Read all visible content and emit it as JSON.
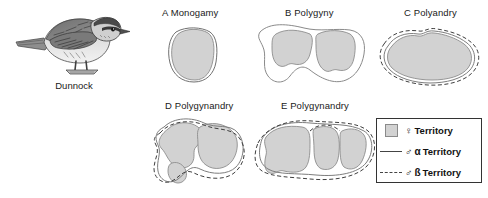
{
  "figure": {
    "title_present": false,
    "background_color": "#ffffff"
  },
  "bird": {
    "caption": "Dunnock",
    "icon_name": "dunnock-bird-illustration"
  },
  "panels": [
    {
      "id": "A",
      "label": "A Monogamy",
      "female_territories": 1,
      "alpha_male": true,
      "beta_male": false
    },
    {
      "id": "B",
      "label": "B Polygyny",
      "female_territories": 2,
      "alpha_male": true,
      "beta_male": false
    },
    {
      "id": "C",
      "label": "C Polyandry",
      "female_territories": 1,
      "alpha_male": true,
      "beta_male": true
    },
    {
      "id": "D",
      "label": "D Polygynandry",
      "female_territories": 2,
      "alpha_male": true,
      "beta_male": true
    },
    {
      "id": "E",
      "label": "E Polygynandry",
      "female_territories": 3,
      "alpha_male": true,
      "beta_male": true
    }
  ],
  "legend": {
    "items": [
      {
        "symbol": "♀",
        "label": "Territory",
        "swatch": "filled-square",
        "color": "#d2d2d2"
      },
      {
        "symbol": "♂",
        "greek": "α",
        "label": "Territory",
        "swatch": "solid-line",
        "color": "#444444"
      },
      {
        "symbol": "♂",
        "greek": "ß",
        "label": "Territory",
        "swatch": "dashed-line",
        "color": "#444444"
      }
    ]
  },
  "colors": {
    "female_fill": "#d2d2d2",
    "female_stroke": "#8a8a8a",
    "male_alpha_stroke": "#666666",
    "male_beta_stroke": "#444444",
    "text": "#1a1a1a"
  }
}
